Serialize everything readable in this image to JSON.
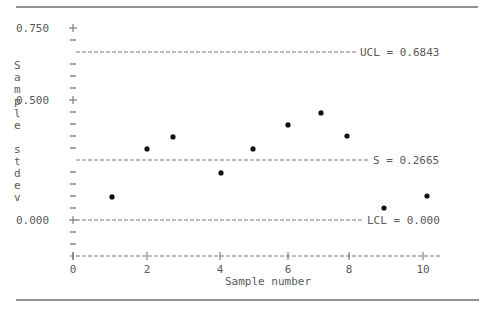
{
  "chart_data": {
    "type": "scatter",
    "title": "",
    "xlabel": "Sample number",
    "ylabel": "Sample stdev",
    "x_ticks": [
      0,
      2,
      4,
      6,
      8,
      10
    ],
    "y_ticks": [
      "0.750",
      "0.500",
      "0.000"
    ],
    "xlim": [
      0,
      10
    ],
    "ylim": [
      -0.15,
      0.75
    ],
    "grid": false,
    "series": [
      {
        "name": "Sample stdev",
        "x": [
          1,
          2,
          3,
          4,
          5,
          6,
          7,
          8,
          9,
          10
        ],
        "y": [
          0.096,
          0.296,
          0.346,
          0.196,
          0.296,
          0.396,
          0.446,
          0.35,
          0.05,
          0.1
        ]
      }
    ],
    "reference_lines": [
      {
        "name": "UCL",
        "value": 0.6843,
        "label": "UCL = 0.6843"
      },
      {
        "name": "S",
        "value": 0.2665,
        "label": "S = 0.2665"
      },
      {
        "name": "LCL",
        "value": 0.0,
        "label": "LCL = 0.000"
      }
    ]
  },
  "axis": {
    "y_label_chars": [
      "S",
      "a",
      "m",
      "p",
      "l",
      "e",
      "",
      "s",
      "t",
      "d",
      "e",
      "v"
    ],
    "y_tick_labels": {
      "t0750": "0.750",
      "t0500": "0.500",
      "t0000": "0.000"
    },
    "x_tick_labels": [
      "0",
      "2",
      "4",
      "6",
      "8",
      "10"
    ],
    "x_title": "Sample number"
  },
  "colors": {
    "text": "#5a5a5a",
    "points": "#111111",
    "lines": "#7a7a7a"
  }
}
